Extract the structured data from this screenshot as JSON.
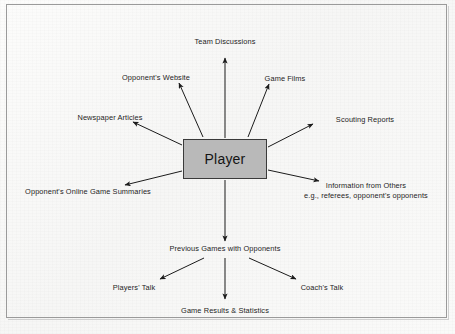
{
  "diagram": {
    "center": {
      "label": "Player",
      "fill_color": "#b9b9b9",
      "border_color": "#3a3a3a"
    },
    "background_color": "#fbfbfa",
    "frame_color": "#9a9a9a",
    "text_color": "#1d1d1d",
    "nodes": [
      {
        "id": "team-discussions",
        "label": "Team Discussions"
      },
      {
        "id": "opponents-website",
        "label": "Opponent's Website"
      },
      {
        "id": "game-films",
        "label": "Game Films"
      },
      {
        "id": "newspaper-articles",
        "label": "Newspaper Articles"
      },
      {
        "id": "scouting-reports",
        "label": "Scouting Reports"
      },
      {
        "id": "opponents-online-game-summaries",
        "label": "Opponent's Online Game Summaries"
      },
      {
        "id": "information-from-others-line1",
        "label": "Information from Others"
      },
      {
        "id": "information-from-others-line2",
        "label": "e.g., referees, opponent's opponents"
      },
      {
        "id": "previous-games-with-opponents",
        "label": "Previous Games with Opponents"
      },
      {
        "id": "players-talk",
        "label": "Players' Talk"
      },
      {
        "id": "coachs-talk",
        "label": "Coach's Talk"
      },
      {
        "id": "game-results-and-statistics",
        "label": "Game Results & Statistics"
      }
    ]
  }
}
